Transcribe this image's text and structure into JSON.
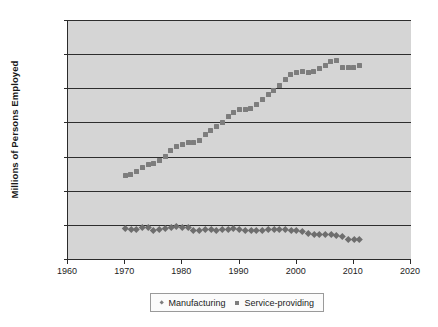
{
  "chart_data": {
    "type": "scatter",
    "title": "",
    "xlabel": "",
    "ylabel": "Millions of Persons Employed",
    "xlim": [
      1960,
      2020
    ],
    "ylim": [
      0,
      140000
    ],
    "xticks": [
      "1960",
      "1970",
      "1980",
      "1990",
      "2000",
      "2010",
      "2020"
    ],
    "xtick_values": [
      1960,
      1970,
      1980,
      1990,
      2000,
      2010,
      2020
    ],
    "yticks": [
      "0",
      "20,000",
      "40,000",
      "60,000",
      "80,000",
      "100,000",
      "120,000",
      "140,000"
    ],
    "ytick_values": [
      0,
      20000,
      40000,
      60000,
      80000,
      100000,
      120000,
      140000
    ],
    "grid": true,
    "legend_position": "bottom",
    "plot_background": "#d5d5d5",
    "marker_color": "#7d7d7d",
    "axis_color": "#2b2b2b",
    "x": [
      1970,
      1971,
      1972,
      1973,
      1974,
      1975,
      1976,
      1977,
      1978,
      1979,
      1980,
      1981,
      1982,
      1983,
      1984,
      1985,
      1986,
      1987,
      1988,
      1989,
      1990,
      1991,
      1992,
      1993,
      1994,
      1995,
      1996,
      1997,
      1998,
      1999,
      2000,
      2001,
      2002,
      2003,
      2004,
      2005,
      2006,
      2007,
      2008,
      2009,
      2010,
      2011
    ],
    "series": [
      {
        "name": "Manufacturing",
        "marker": "diamond",
        "values": [
          17800,
          17200,
          17600,
          18400,
          18300,
          16900,
          17400,
          18000,
          18700,
          19400,
          18700,
          18500,
          17000,
          16800,
          17500,
          17400,
          17100,
          17200,
          17600,
          17700,
          17400,
          16800,
          16600,
          16800,
          17100,
          17200,
          17200,
          17400,
          17500,
          17100,
          17000,
          16100,
          15200,
          14500,
          14300,
          14200,
          14200,
          13900,
          13400,
          11800,
          11500,
          11700
        ]
      },
      {
        "name": "Service-providing",
        "marker": "square",
        "values": [
          49100,
          49600,
          51500,
          53500,
          55200,
          55700,
          57800,
          60100,
          63300,
          66000,
          67000,
          68200,
          68000,
          69400,
          73000,
          75500,
          77600,
          80200,
          83400,
          86000,
          87400,
          87400,
          88400,
          90600,
          93600,
          96300,
          98800,
          101900,
          105300,
          108300,
          109300,
          109600,
          109100,
          110100,
          111800,
          113600,
          115500,
          116500,
          112300,
          112200,
          112300,
          113600
        ]
      }
    ]
  },
  "legend": {
    "entries": [
      {
        "label": "Manufacturing"
      },
      {
        "label": "Service-providing"
      }
    ]
  }
}
